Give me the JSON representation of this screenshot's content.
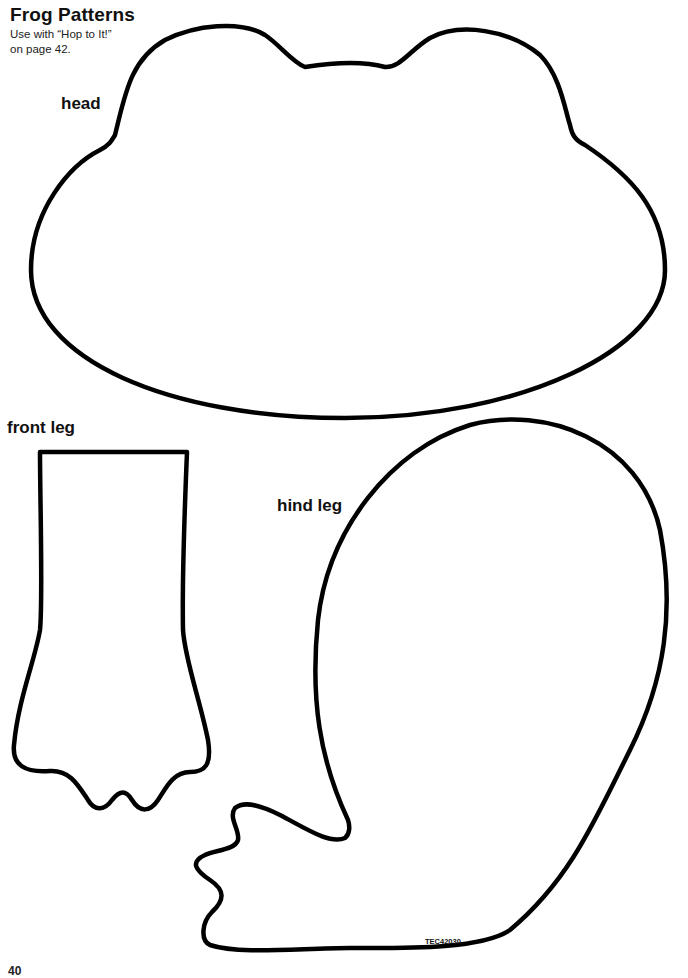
{
  "header": {
    "title": "Frog Patterns",
    "subtitle_line1": "Use with “Hop to It!”",
    "subtitle_line2": "on page 42."
  },
  "patterns": {
    "head": {
      "label": "head"
    },
    "front_leg": {
      "label": "front leg"
    },
    "hind_leg": {
      "label": "hind leg"
    }
  },
  "footer": {
    "code": "TEC42030",
    "page_number": "40"
  },
  "colors": {
    "outline": "#000000",
    "background": "#ffffff"
  }
}
